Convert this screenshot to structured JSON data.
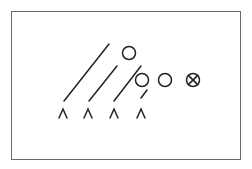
{
  "diagram": {
    "type": "football-play-formation",
    "colors": {
      "border": "#6a6a6a",
      "stroke": "#222222",
      "background": "#ffffff"
    },
    "defenders": [
      {
        "symbol": "^",
        "x": 63,
        "y": 113
      },
      {
        "symbol": "^",
        "x": 88,
        "y": 113
      },
      {
        "symbol": "^",
        "x": 114,
        "y": 113
      },
      {
        "symbol": "^",
        "x": 141,
        "y": 113
      }
    ],
    "offense": [
      {
        "kind": "circle",
        "x": 129,
        "y": 53
      },
      {
        "kind": "circle",
        "x": 142,
        "y": 80
      },
      {
        "kind": "circle",
        "x": 165,
        "y": 80
      },
      {
        "kind": "center-circle-x",
        "x": 193,
        "y": 80
      }
    ],
    "routes": [
      {
        "x1": 64,
        "y1": 101,
        "x2": 109,
        "y2": 44
      },
      {
        "x1": 89,
        "y1": 101,
        "x2": 117,
        "y2": 66
      },
      {
        "x1": 114,
        "y1": 101,
        "x2": 141,
        "y2": 66
      },
      {
        "x1": 141,
        "y1": 98,
        "x2": 147,
        "y2": 90
      }
    ]
  }
}
